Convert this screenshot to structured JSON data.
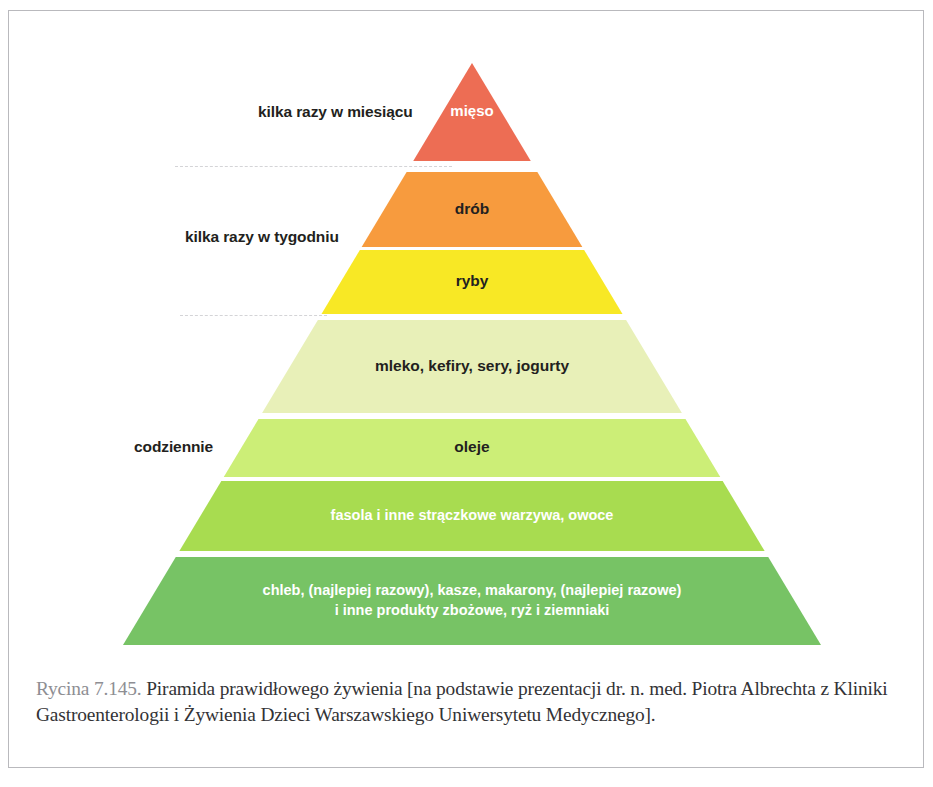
{
  "figure": {
    "type": "food-pyramid",
    "title": "Piramida prawidłowego żywienia",
    "apex": {
      "x": 472,
      "y": 63
    },
    "base": {
      "left_x": 125,
      "right_x": 823,
      "y": 645
    },
    "tiers": [
      {
        "id": "meat",
        "label": "mięso",
        "color": "#ED6D54",
        "text_color": "#ffffff",
        "frequency_group": "monthly",
        "top_y": 63,
        "bottom_y": 161,
        "font_size": 15,
        "lines": [
          "mięso"
        ]
      },
      {
        "id": "poultry",
        "label": "drób",
        "color": "#F79B3E",
        "text_color": "#231f20",
        "frequency_group": "weekly",
        "top_y": 172,
        "bottom_y": 247,
        "font_size": 15.5,
        "lines": [
          "drób"
        ]
      },
      {
        "id": "fish",
        "label": "ryby",
        "color": "#F8E825",
        "text_color": "#231f20",
        "frequency_group": "weekly",
        "top_y": 250,
        "bottom_y": 314,
        "font_size": 15.5,
        "lines": [
          "ryby"
        ]
      },
      {
        "id": "dairy",
        "label": "mleko, kefiry, sery, jogurty",
        "color": "#E8F0B8",
        "text_color": "#231f20",
        "frequency_group": "daily",
        "top_y": 320,
        "bottom_y": 413,
        "font_size": 15.5,
        "lines": [
          "mleko, kefiry, sery, jogurty"
        ]
      },
      {
        "id": "oils",
        "label": "oleje",
        "color": "#CCEE77",
        "text_color": "#231f20",
        "frequency_group": "daily",
        "top_y": 419,
        "bottom_y": 477,
        "font_size": 15.5,
        "lines": [
          "oleje"
        ]
      },
      {
        "id": "legumes",
        "label": "fasola i inne strączkowe warzywa, owoce",
        "color": "#A8DC50",
        "text_color": "#ffffff",
        "frequency_group": "daily",
        "top_y": 481,
        "bottom_y": 551,
        "font_size": 14.5,
        "lines": [
          "fasola i inne strączkowe warzywa, owoce"
        ]
      },
      {
        "id": "grains",
        "label": "chleb, (najlepiej razowy), kasze, makarony, (najlepiej razowe) i inne produkty zbożowe, ryż i ziemniaki",
        "color": "#77C365",
        "text_color": "#ffffff",
        "frequency_group": "daily",
        "top_y": 557,
        "bottom_y": 645,
        "font_size": 14.5,
        "lines": [
          "chleb, (najlepiej razowy), kasze, makarony, (najlepiej razowe)",
          "i inne produkty zbożowe, ryż i ziemniaki"
        ]
      }
    ],
    "side_labels": [
      {
        "id": "monthly",
        "text": "kilka razy w miesiącu"
      },
      {
        "id": "weekly",
        "text": "kilka razy w tygodniu"
      },
      {
        "id": "daily",
        "text": "codziennie"
      }
    ]
  },
  "caption": {
    "reference": "Rycina 7.145.",
    "text": " Piramida prawidłowego żywienia [na podstawie prezentacji dr. n. med. Piotra Albrechta z Kliniki Gastroenterologii i Żywienia Dzieci Warszawskiego Uniwersytetu Medycznego]."
  }
}
